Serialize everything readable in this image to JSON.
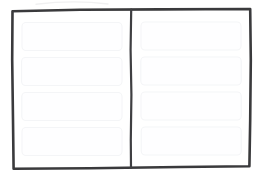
{
  "sketch": {
    "title": "Two Column Wireframe Sketch",
    "description": "Hand-drawn low-fidelity wireframe: outer frame divided by a vertical line into a left and a right column, each holding four blank placeholder blocks.",
    "style": "hand-drawn-lofi",
    "colors": {
      "background": "#ffffff",
      "frame_stroke": "#3a3a3c",
      "divider_stroke": "#3f3f42",
      "placeholder_fill": "#fefeff",
      "placeholder_stroke": "#f4f5f7",
      "smudge": "#f0f0f1"
    },
    "frame": {
      "name": "outer-frame",
      "label": "",
      "path": "M 12.5 11.2 L 80 9.8 L 160 9.4 L 250.2 9.0 L 250.8 60 L 250.2 120 L 249.4 166.2 L 180 167.0 L 90 168.2 L 13.6 168.8 L 13.0 120 L 12.2 60 Z"
    },
    "divider": {
      "name": "column-divider",
      "label": "",
      "path": "M 131.2 9.6 L 130.6 50 L 131.4 95 L 130.8 140 L 131.0 167.6"
    },
    "smudges": [
      {
        "name": "paper-smudge-top",
        "path": "M 36 4.2 C 58 1.6, 86 1.2, 108 4.0"
      }
    ],
    "columns": [
      {
        "name": "left-column",
        "label": "",
        "blocks": [
          {
            "name": "placeholder-block",
            "label": "",
            "x": 22.0,
            "y": 22.5,
            "w": 100.0,
            "h": 28.0,
            "r": 4.0
          },
          {
            "name": "placeholder-block",
            "label": "",
            "x": 21.6,
            "y": 57.5,
            "w": 100.4,
            "h": 28.0,
            "r": 4.0
          },
          {
            "name": "placeholder-block",
            "label": "",
            "x": 21.8,
            "y": 92.5,
            "w": 100.2,
            "h": 28.0,
            "r": 4.0
          },
          {
            "name": "placeholder-block",
            "label": "",
            "x": 22.0,
            "y": 127.5,
            "w": 100.0,
            "h": 28.0,
            "r": 4.0
          }
        ]
      },
      {
        "name": "right-column",
        "label": "",
        "blocks": [
          {
            "name": "placeholder-block",
            "label": "",
            "x": 141.0,
            "y": 22.0,
            "w": 100.0,
            "h": 28.0,
            "r": 4.0
          },
          {
            "name": "placeholder-block",
            "label": "",
            "x": 140.8,
            "y": 57.0,
            "w": 100.4,
            "h": 28.0,
            "r": 4.0
          },
          {
            "name": "placeholder-block",
            "label": "",
            "x": 141.0,
            "y": 92.0,
            "w": 100.2,
            "h": 28.0,
            "r": 4.0
          },
          {
            "name": "placeholder-block",
            "label": "",
            "x": 141.2,
            "y": 127.0,
            "w": 100.0,
            "h": 28.0,
            "r": 4.0
          }
        ]
      }
    ]
  }
}
